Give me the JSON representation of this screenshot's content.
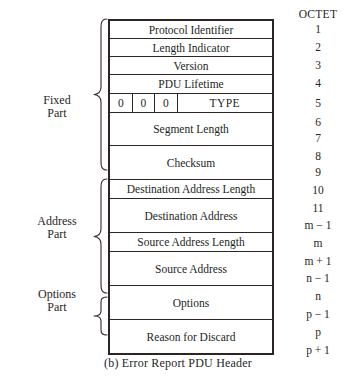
{
  "figure": {
    "caption": "(b) Error Report PDU Header",
    "octet_header": "OCTET",
    "sections": [
      {
        "id": "fixed",
        "line1": "Fixed",
        "line2": "Part"
      },
      {
        "id": "address",
        "line1": "Address",
        "line2": "Part"
      },
      {
        "id": "options",
        "line1": "Options",
        "line2": "Part"
      }
    ],
    "rows": [
      {
        "id": "protocol-identifier",
        "label": "Protocol Identifier",
        "type": "plain"
      },
      {
        "id": "length-indicator",
        "label": "Length Indicator",
        "type": "plain"
      },
      {
        "id": "version",
        "label": "Version",
        "type": "plain"
      },
      {
        "id": "pdu-lifetime",
        "label": "PDU Lifetime",
        "type": "plain"
      },
      {
        "id": "flags-type",
        "label": "TYPE",
        "bits": [
          "0",
          "0",
          "0"
        ],
        "type": "split"
      },
      {
        "id": "segment-length",
        "label": "Segment Length",
        "type": "plain"
      },
      {
        "id": "checksum",
        "label": "Checksum",
        "type": "plain"
      },
      {
        "id": "destination-address-length",
        "label": "Destination Address Length",
        "type": "plain"
      },
      {
        "id": "destination-address",
        "label": "Destination Address",
        "type": "plain"
      },
      {
        "id": "source-address-length",
        "label": "Source Address Length",
        "type": "plain"
      },
      {
        "id": "source-address",
        "label": "Source Address",
        "type": "plain"
      },
      {
        "id": "options",
        "label": "Options",
        "type": "plain"
      },
      {
        "id": "reason-for-discard",
        "label": "Reason for Discard",
        "type": "plain"
      }
    ],
    "octets": [
      "1",
      "2",
      "3",
      "4",
      "5",
      "6",
      "7",
      "8",
      "9",
      "10",
      "11",
      "m − 1",
      "m",
      "m + 1",
      "n − 1",
      "n",
      "p − 1",
      "p",
      "p + 1"
    ]
  }
}
